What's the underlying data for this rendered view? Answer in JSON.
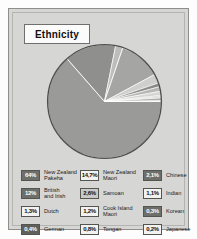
{
  "panel": {
    "title": "Ethnicity",
    "background_color": "#d6d6d4",
    "border_color": "#8e8e8c"
  },
  "chart_data": {
    "type": "pie",
    "title": "Ethnicity",
    "xlabel": "",
    "ylabel": "",
    "legend_position": "bottom",
    "grid": false,
    "value_suffix": "%",
    "decimal_separator": ",",
    "categories": [
      "New Zealand Pakeha",
      "New Zealand Maori",
      "Chinese",
      "British and Irish",
      "Samoan",
      "Indian",
      "Dutch",
      "Cook Island Maori",
      "Korean",
      "German",
      "Tongan",
      "Japanese"
    ],
    "values": [
      64.0,
      14.7,
      2.1,
      12.0,
      2.6,
      1.1,
      1.3,
      1.2,
      0.3,
      0.4,
      0.8,
      0.2
    ],
    "slice_colors": [
      "#9a9a98",
      "#8f8f8d",
      "#bdbdbb",
      "#a5a5a3",
      "#cfcfcd",
      "#8a8a88",
      "#b6b6b4",
      "#d6d6d4",
      "#9e9e9c",
      "#c4c4c2",
      "#ababa9",
      "#e2e2e0"
    ]
  },
  "legend": {
    "columns": [
      {
        "name": "column-1",
        "items": [
          {
            "value": "64%",
            "label": "New Zealand\nPakeha",
            "swatch_color": "#6e6e6a"
          },
          {
            "value": "12%",
            "label": "British\nand Irish",
            "swatch_color": "#6e6e6a"
          },
          {
            "value": "1,3%",
            "label": "Dutch",
            "swatch_color": "#f2f2f0"
          },
          {
            "value": "0,4%",
            "label": "German",
            "swatch_color": "#5f5f5b"
          }
        ]
      },
      {
        "name": "column-2",
        "items": [
          {
            "value": "14,7%",
            "label": "New Zealand\nMaori",
            "swatch_color": "#f2f2f0"
          },
          {
            "value": "2,6%",
            "label": "Samoan",
            "swatch_color": "#c9c9c7"
          },
          {
            "value": "1,2%",
            "label": "Cook Island\nMaori",
            "swatch_color": "#f2f2f0"
          },
          {
            "value": "0,8%",
            "label": "Tongan",
            "swatch_color": "#f2f2f0"
          }
        ]
      },
      {
        "name": "column-3",
        "items": [
          {
            "value": "2,1%",
            "label": "Chinese",
            "swatch_color": "#6e6e6a"
          },
          {
            "value": "1,1%",
            "label": "Indian",
            "swatch_color": "#f2f2f0"
          },
          {
            "value": "0,3%",
            "label": "Korean",
            "swatch_color": "#6e6e6a"
          },
          {
            "value": "0,2%",
            "label": "Japanese",
            "swatch_color": "#f2f2f0"
          }
        ]
      }
    ]
  }
}
